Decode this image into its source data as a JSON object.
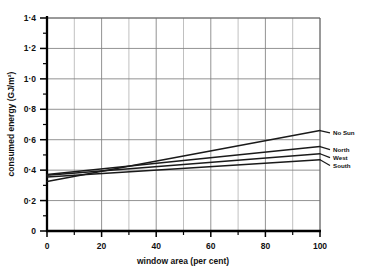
{
  "chart_data": {
    "type": "line",
    "title": "",
    "xlabel": "window area (per cent)",
    "ylabel": "consumed energy (GJ/m²)",
    "xlim": [
      0,
      100
    ],
    "ylim": [
      0,
      1.4
    ],
    "grid": true,
    "legend_position": "right-of-plot-line-ends",
    "x_ticks": [
      0,
      20,
      40,
      60,
      80,
      100
    ],
    "x_tick_labels": [
      "0",
      "20",
      "40",
      "60",
      "80",
      "100"
    ],
    "x_minor_ticks": [
      10,
      30,
      50,
      70,
      90
    ],
    "y_ticks": [
      0,
      0.2,
      0.4,
      0.6,
      0.8,
      1.0,
      1.2,
      1.4
    ],
    "y_tick_labels": [
      "0",
      "0·2",
      "0·4",
      "0·6",
      "0·8",
      "1·0",
      "1·2",
      "1·4"
    ],
    "y_minor_ticks": [
      0.1,
      0.3,
      0.5,
      0.7,
      0.9,
      1.1,
      1.3
    ],
    "x": [
      0,
      100
    ],
    "series": [
      {
        "name": "No Sun",
        "label": "No Sun",
        "values": [
          0.325,
          0.66
        ],
        "color": "#1a1a1a",
        "label_y": 0.645
      },
      {
        "name": "North",
        "label": "North",
        "values": [
          0.372,
          0.555
        ],
        "color": "#1a1a1a",
        "label_y": 0.535
      },
      {
        "name": "West",
        "label": "West",
        "values": [
          0.366,
          0.508
        ],
        "color": "#1a1a1a",
        "label_y": 0.482
      },
      {
        "name": "South",
        "label": "South",
        "values": [
          0.355,
          0.468
        ],
        "color": "#1a1a1a",
        "label_y": 0.43
      }
    ]
  },
  "axes": {
    "x_title": "window area (per cent)",
    "y_title": "consumed energy (GJ/m²)"
  },
  "colors": {
    "background": "#ffffff",
    "axis": "#000000",
    "grid": "#808080",
    "line": "#1a1a1a",
    "text": "#111111"
  }
}
